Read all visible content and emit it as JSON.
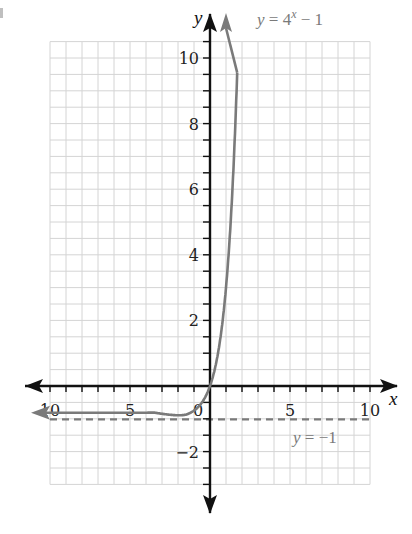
{
  "chart_data": {
    "type": "line",
    "title": "",
    "xlabel": "x",
    "ylabel": "y",
    "xlim": [
      -10,
      10
    ],
    "ylim": [
      -3,
      10.5
    ],
    "grid": true,
    "grid_spacing": {
      "x": 1,
      "y": 0.5
    },
    "x_ticks": [
      -10,
      -5,
      0,
      5,
      10
    ],
    "x_tick_labels": [
      "10",
      "5",
      "0",
      "5",
      "10"
    ],
    "y_ticks": [
      10,
      8,
      6,
      4,
      2,
      -2
    ],
    "y_tick_labels": [
      "10",
      "8",
      "6",
      "4",
      "2",
      "−2"
    ],
    "series": [
      {
        "name": "y = 4^x − 1",
        "function": "4^x - 1",
        "color": "#7a7a7a",
        "style": "solid",
        "arrows": "both",
        "x": [
          -10.8,
          -10,
          -8,
          -6,
          -5,
          -4,
          -3,
          -2,
          -1.5,
          -1,
          -0.5,
          0,
          0.5,
          1,
          1.25,
          1.5,
          1.6,
          1.7
        ],
        "y": [
          -1,
          -1,
          -1,
          -1,
          -0.999,
          -0.996,
          -0.984,
          -0.9375,
          -0.875,
          -0.75,
          -0.5,
          0,
          1,
          3,
          4.66,
          7,
          8.19,
          9.56
        ]
      },
      {
        "name": "y = −1",
        "function": "-1",
        "color": "#7a7a7a",
        "style": "dashed",
        "x": [
          -10,
          10
        ],
        "y": [
          -1,
          -1
        ]
      }
    ],
    "annotations": [
      {
        "text_main": "y = 4",
        "text_sup": "x",
        "text_tail": " − 1",
        "position": "top-right of y-axis"
      },
      {
        "text": "y = −1",
        "position": "below dashed asymptote, right side"
      }
    ],
    "colors": {
      "grid": "#d4d4d4",
      "axes": "#111111",
      "curve": "#7a7a7a",
      "asymptote": "#7a7a7a",
      "labels": "#222222",
      "equation_labels": "#7a7a7a"
    }
  },
  "labels": {
    "x_axis": "x",
    "y_axis": "y",
    "curve_equation_prefix": "y = 4",
    "curve_equation_exponent": "x",
    "curve_equation_suffix": " − 1",
    "asymptote_equation": "y = −1"
  }
}
